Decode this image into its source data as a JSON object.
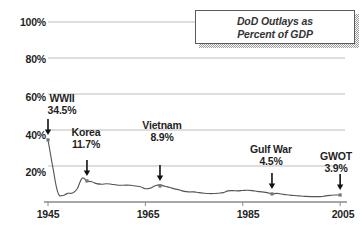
{
  "chart_data": {
    "type": "line",
    "title": "DoD Outlays as Percent of GDP",
    "title_line1": "DoD Outlays as",
    "title_line2": "Percent of GDP",
    "xlabel": "",
    "ylabel": "",
    "xlim": [
      1945,
      2006
    ],
    "ylim": [
      0,
      100
    ],
    "grid": true,
    "legend": "none",
    "ytick_labels": [
      "100%",
      "80%",
      "60%",
      "40%",
      "20%"
    ],
    "ytick_values": [
      100,
      80,
      60,
      40,
      20
    ],
    "xtick_labels": [
      "1945",
      "1965",
      "1985",
      "2005"
    ],
    "xtick_values": [
      1945,
      1965,
      1985,
      2005
    ],
    "series": [
      {
        "name": "DoD Outlays as Percent of GDP",
        "x": [
          1945,
          1946,
          1947,
          1948,
          1949,
          1950,
          1951,
          1952,
          1953,
          1954,
          1955,
          1956,
          1957,
          1958,
          1959,
          1960,
          1961,
          1962,
          1963,
          1964,
          1965,
          1966,
          1967,
          1968,
          1969,
          1970,
          1971,
          1972,
          1973,
          1974,
          1975,
          1976,
          1977,
          1978,
          1979,
          1980,
          1981,
          1982,
          1983,
          1984,
          1985,
          1986,
          1987,
          1988,
          1989,
          1990,
          1991,
          1992,
          1993,
          1994,
          1995,
          1996,
          1997,
          1998,
          1999,
          2000,
          2001,
          2002,
          2003,
          2004,
          2005
        ],
        "values": [
          34.5,
          19.2,
          5.5,
          3.6,
          4.8,
          5.0,
          7.4,
          13.2,
          11.7,
          11.3,
          10.2,
          9.9,
          10.1,
          9.9,
          9.5,
          9.3,
          9.4,
          9.3,
          8.9,
          8.5,
          7.4,
          7.7,
          9.0,
          9.5,
          8.7,
          8.1,
          7.3,
          6.7,
          5.9,
          5.6,
          5.6,
          5.2,
          4.9,
          4.7,
          4.7,
          4.9,
          5.2,
          6.2,
          6.3,
          6.2,
          6.4,
          6.5,
          6.3,
          5.9,
          5.6,
          5.2,
          4.5,
          4.8,
          4.4,
          4.0,
          3.7,
          3.5,
          3.3,
          3.1,
          3.0,
          3.0,
          3.0,
          3.4,
          3.7,
          3.9,
          3.9
        ]
      }
    ],
    "annotations": [
      {
        "id": "wwii",
        "label": "WWII",
        "value": "34.5%",
        "year": 1945,
        "y_value": 34.5
      },
      {
        "id": "korea",
        "label": "Korea",
        "value": "11.7%",
        "year": 1953,
        "y_value": 11.7
      },
      {
        "id": "vietnam",
        "label": "Vietnam",
        "value": "8.9%",
        "year": 1968,
        "y_value": 8.9
      },
      {
        "id": "gulfwar",
        "label": "Gulf War",
        "value": "4.5%",
        "year": 1991,
        "y_value": 4.5
      },
      {
        "id": "gwot",
        "label": "GWOT",
        "value": "3.9%",
        "year": 2005,
        "y_value": 3.9
      }
    ],
    "colors": {
      "line": "#555555",
      "grid": "#bdbdbd",
      "axis": "#8a8a8a",
      "text": "#1f1f1f",
      "title_text": "#333333",
      "marker": "#777777",
      "arrow": "#111111",
      "background": "#ffffff",
      "box_border": "#5a5a5a",
      "box_shadow": "#9a9a9a"
    }
  }
}
